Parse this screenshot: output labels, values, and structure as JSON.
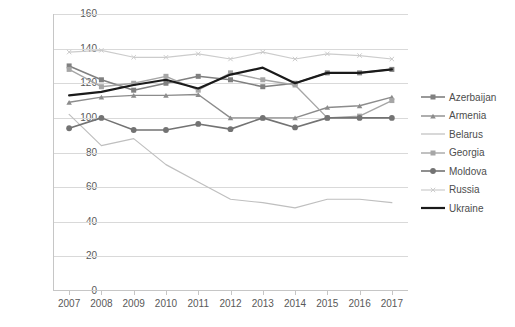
{
  "chart_data": {
    "type": "line",
    "title": "",
    "subtitle": "",
    "xlabel": "",
    "ylabel": "",
    "categories": [
      "2007",
      "2008",
      "2009",
      "2010",
      "2011",
      "2012",
      "2013",
      "2014",
      "2015",
      "2016",
      "2017"
    ],
    "x_tick_labels": [
      "2007",
      "2008",
      "2009",
      "2010",
      "2011",
      "2012",
      "2013",
      "2014",
      "2015",
      "2016",
      "2017"
    ],
    "y_tick_labels": [
      "0",
      "20",
      "40",
      "60",
      "80",
      "100",
      "120",
      "140",
      "160"
    ],
    "y_ticks": [
      0,
      20,
      40,
      60,
      80,
      100,
      120,
      140,
      160
    ],
    "ylim": [
      0,
      160
    ],
    "grid": "horizontal",
    "legend_position": "right",
    "series": [
      {
        "name": "Azerbaijan",
        "color": "#808080",
        "marker": "square",
        "width": 1.6,
        "values": [
          130,
          122,
          116,
          120,
          124,
          122,
          118,
          120,
          126,
          126,
          128
        ]
      },
      {
        "name": "Armenia",
        "color": "#8c8c8c",
        "marker": "triangle",
        "width": 1.4,
        "values": [
          109,
          112,
          113,
          113,
          113.5,
          100,
          100,
          100,
          106,
          107,
          112
        ]
      },
      {
        "name": "Belarus",
        "color": "#bfbfbf",
        "marker": "none",
        "width": 1.2,
        "values": [
          102,
          84,
          88,
          73,
          63,
          53,
          51,
          48,
          53,
          53,
          51
        ]
      },
      {
        "name": "Georgia",
        "color": "#a6a6a6",
        "marker": "square",
        "width": 1.4,
        "values": [
          128,
          118,
          120,
          124,
          116,
          126,
          122,
          119,
          100,
          101,
          110
        ]
      },
      {
        "name": "Moldova",
        "color": "#737373",
        "marker": "circle",
        "width": 1.6,
        "values": [
          94,
          100,
          93,
          93,
          96.5,
          93.5,
          100,
          94.5,
          100,
          100,
          100
        ]
      },
      {
        "name": "Russia",
        "color": "#cccccc",
        "marker": "x",
        "width": 1.2,
        "values": [
          138,
          139,
          135,
          135,
          137,
          134,
          138,
          134,
          137,
          136,
          134
        ]
      },
      {
        "name": "Ukraine",
        "color": "#1a1a1a",
        "marker": "none",
        "width": 2.2,
        "values": [
          113,
          115,
          119,
          122,
          117,
          125,
          129,
          120,
          126,
          126,
          128
        ]
      }
    ]
  },
  "legend": {
    "items": [
      {
        "label": "Azerbaijan"
      },
      {
        "label": "Armenia"
      },
      {
        "label": "Belarus"
      },
      {
        "label": "Georgia"
      },
      {
        "label": "Moldova"
      },
      {
        "label": "Russia"
      },
      {
        "label": "Ukraine"
      }
    ]
  },
  "caption": {
    "text": ""
  }
}
